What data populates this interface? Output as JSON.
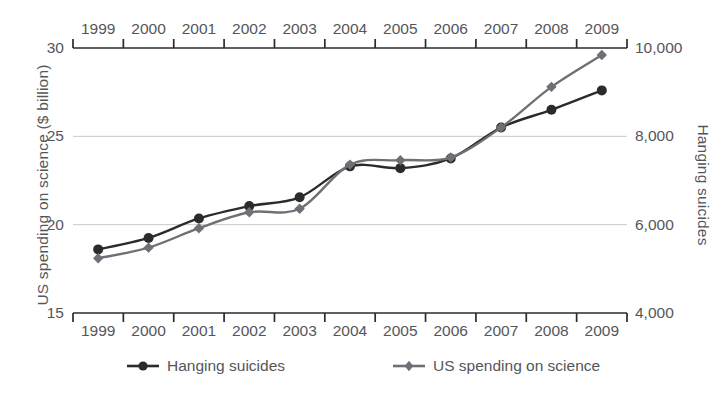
{
  "chart_data": {
    "type": "line",
    "title": "",
    "subtitle": "",
    "xlabel": "",
    "categories": [
      "1999",
      "2000",
      "2001",
      "2002",
      "2003",
      "2004",
      "2005",
      "2006",
      "2007",
      "2008",
      "2009"
    ],
    "grid": true,
    "legend_position": "bottom",
    "axes": {
      "left": {
        "label": "US spending on science ($ billion)",
        "ticks": [
          "15",
          "20",
          "25",
          "30"
        ],
        "tick_values": [
          15,
          20,
          25,
          30
        ],
        "ylim": [
          15,
          30
        ]
      },
      "right": {
        "label": "Hanging suicides",
        "ticks": [
          "4,000",
          "6,000",
          "8,000",
          "10,000"
        ],
        "tick_values": [
          4000,
          6000,
          8000,
          10000
        ],
        "ylim": [
          4000,
          10000
        ]
      },
      "top": {
        "ticks": [
          "1999",
          "2000",
          "2001",
          "2002",
          "2003",
          "2004",
          "2005",
          "2006",
          "2007",
          "2008",
          "2009"
        ]
      },
      "bottom": {
        "ticks": [
          "1999",
          "2000",
          "2001",
          "2002",
          "2003",
          "2004",
          "2005",
          "2006",
          "2007",
          "2008",
          "2009"
        ]
      }
    },
    "series": [
      {
        "name": "Hanging suicides",
        "axis": "right",
        "color": "#2b2b2b",
        "marker": "circle",
        "values": [
          6430,
          6700,
          7140,
          7410,
          7620,
          8330,
          8290,
          8500,
          8200,
          9100,
          9050
        ],
        "left_scale_values": [
          18.6,
          19.25,
          20.35,
          21.05,
          21.55,
          23.3,
          23.2,
          23.75,
          25.5,
          26.5,
          27.6
        ]
      },
      {
        "name": "US spending on science",
        "axis": "left",
        "color": "#6e7075",
        "marker": "diamond",
        "values": [
          18.1,
          18.7,
          19.8,
          20.7,
          20.9,
          23.4,
          23.65,
          23.8,
          25.5,
          27.8,
          29.6
        ]
      }
    ]
  },
  "legend": {
    "items": [
      {
        "label": "Hanging suicides",
        "color": "#2b2b2b",
        "marker": "circle"
      },
      {
        "label": "US spending on science",
        "color": "#6e7075",
        "marker": "diamond"
      }
    ]
  }
}
